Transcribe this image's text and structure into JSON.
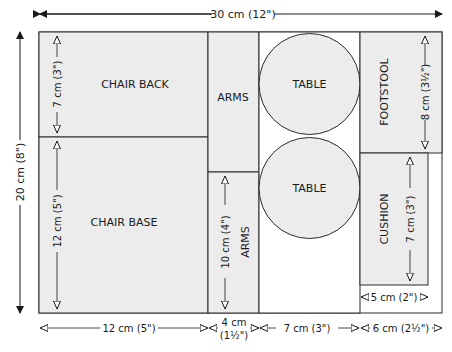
{
  "diagram": {
    "overall": {
      "width_label": "30 cm (12\")",
      "height_label": "20 cm (8\")"
    },
    "pieces": {
      "chair_back": {
        "label": "CHAIR BACK",
        "dim_label": "7 cm (3\")"
      },
      "chair_base": {
        "label": "CHAIR BASE",
        "dim_label": "12 cm (5\")"
      },
      "arms_top": {
        "label": "ARMS"
      },
      "arms_bottom": {
        "label": "ARMS",
        "dim_label": "10 cm (4\")"
      },
      "table_top": {
        "label": "TABLE"
      },
      "table_bottom": {
        "label": "TABLE"
      },
      "footstool": {
        "label": "FOOTSTOOL",
        "dim_label": "8 cm (3½\")"
      },
      "cushion": {
        "label": "CUSHION",
        "dim_label": "7 cm (3\")",
        "width_label": "5 cm (2\")"
      }
    },
    "bottom_dims": {
      "col1": "12 cm (5\")",
      "col2_line1": "4 cm",
      "col2_line2": "(1½\")",
      "col3": "7 cm (3\")",
      "col4": "6 cm (2½\")"
    },
    "colors": {
      "fill": "#ececec",
      "stroke": "#2a2a2a",
      "background": "#ffffff"
    }
  }
}
